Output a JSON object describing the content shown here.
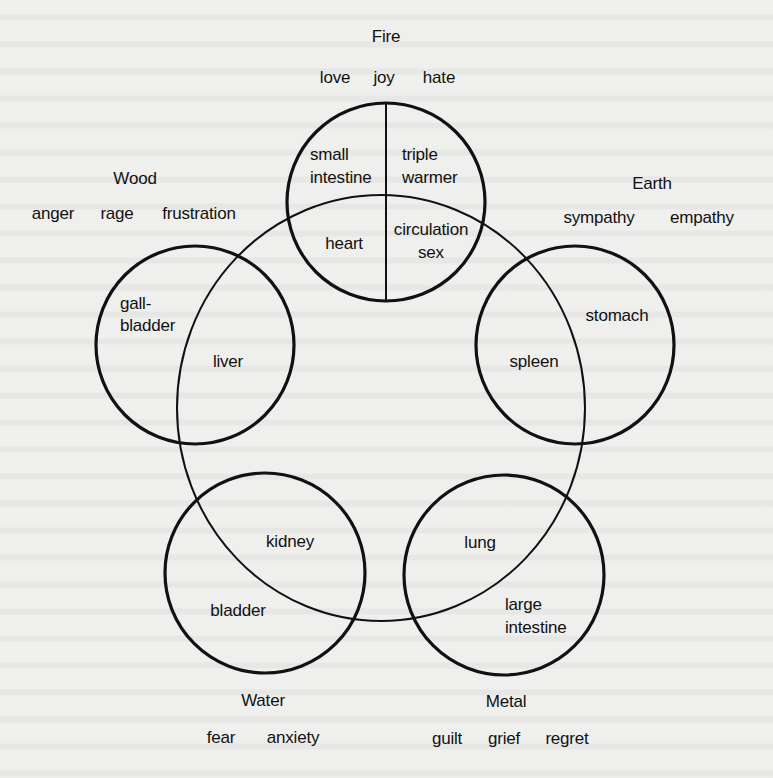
{
  "diagram": {
    "type": "five-elements",
    "central_circle": {
      "cx": 381,
      "cy": 408,
      "rx": 204,
      "ry": 213
    },
    "elements": [
      {
        "name": "Fire",
        "emotions": [
          "love",
          "joy",
          "hate"
        ],
        "circle": {
          "cx": 386,
          "cy": 202,
          "r": 99
        },
        "organs": [
          "small intestine",
          "triple warmer",
          "heart",
          "circulation sex"
        ],
        "organ_lines": {
          "small_intestine": [
            "small",
            "intestine"
          ],
          "triple_warmer": [
            "triple",
            "warmer"
          ],
          "heart": [
            "heart"
          ],
          "circulation_sex": [
            "circulation",
            "sex"
          ]
        }
      },
      {
        "name": "Earth",
        "emotions": [
          "sympathy",
          "empathy"
        ],
        "circle": {
          "cx": 575,
          "cy": 345,
          "r": 99
        },
        "organs": [
          "stomach",
          "spleen"
        ]
      },
      {
        "name": "Metal",
        "emotions": [
          "guilt",
          "grief",
          "regret"
        ],
        "circle": {
          "cx": 504,
          "cy": 575,
          "r": 100
        },
        "organs": [
          "lung",
          "large intestine"
        ],
        "organ_lines": {
          "large_intestine": [
            "large",
            "intestine"
          ]
        }
      },
      {
        "name": "Water",
        "emotions": [
          "fear",
          "anxiety"
        ],
        "circle": {
          "cx": 265,
          "cy": 573,
          "r": 100
        },
        "organs": [
          "kidney",
          "bladder"
        ]
      },
      {
        "name": "Wood",
        "emotions": [
          "anger",
          "rage",
          "frustration"
        ],
        "circle": {
          "cx": 195,
          "cy": 345,
          "r": 99
        },
        "organs": [
          "gall-bladder",
          "liver"
        ],
        "organ_lines": {
          "gall_bladder": [
            "gall-",
            "bladder"
          ]
        }
      }
    ]
  }
}
